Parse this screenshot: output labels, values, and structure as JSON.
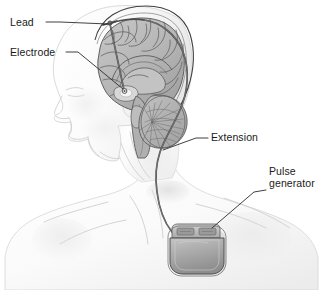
{
  "figure": {
    "background_color": "#ffffff",
    "width": 329,
    "height": 290
  },
  "labels": [
    {
      "id": "lead",
      "text": "Lead",
      "x": 10,
      "y": 26,
      "anchor": "start",
      "points_to": "lead wire entering the skull through a burr hole at the top of the head"
    },
    {
      "id": "electrode",
      "text": "Electrode",
      "x": 10,
      "y": 56,
      "anchor": "start",
      "points_to": "electrode tip seated deep in the thalamus"
    },
    {
      "id": "extension",
      "text": "Extension",
      "x": 211,
      "y": 141,
      "anchor": "start",
      "points_to": "extension cable running down the side of the neck"
    },
    {
      "id": "pulse-generator-line1",
      "text": "Pulse",
      "x": 269,
      "y": 175,
      "anchor": "start",
      "points_to": "implanted pulse generator in the upper chest"
    },
    {
      "id": "pulse-generator-line2",
      "text": "generator",
      "x": 269,
      "y": 187,
      "anchor": "start",
      "points_to": "implanted pulse generator in the upper chest"
    }
  ],
  "anatomy": {
    "head": "lateral profile of a human head facing left",
    "brain_structures": [
      "cerebral cortex with gyri and sulci",
      "corpus callosum",
      "thalamus",
      "brainstem",
      "cerebellum with arbor vitae"
    ],
    "body": "neck, shoulders and upper chest"
  },
  "device": {
    "lead": "thin insulated wire passing from the scalp down into deep brain tissue",
    "electrode": "stimulating contact at the distal tip of the lead",
    "extension": "connecting cable tunneled under the skin behind the ear and down the neck",
    "pulse_generator": "rounded rectangular implantable pulse generator with a two-port connector header"
  },
  "colors": {
    "background": "#ffffff",
    "skin_light": "#f7f7f7",
    "skin_shadow": "#e3e3e3",
    "brain_fill": "#b4b4b4",
    "brain_light": "#c8c8c8",
    "brain_dark": "#8f8f8f",
    "wire": "#4a4a4a",
    "device_body": "#a8a8a8",
    "device_header": "#bdbdbd",
    "label_text": "#1a1a1a",
    "leader_line": "#2b2b2b"
  }
}
